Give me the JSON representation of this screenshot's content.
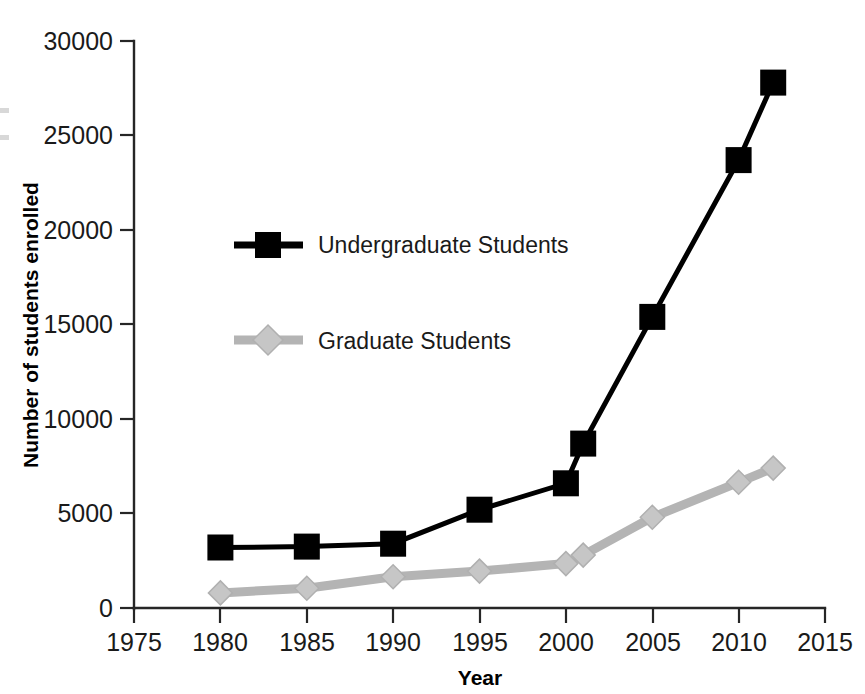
{
  "chart_data": {
    "type": "line",
    "title": "",
    "xlabel": "Year",
    "ylabel": "Number of students enrolled",
    "xlim": [
      1975,
      2015
    ],
    "ylim": [
      0,
      30000
    ],
    "xticks": [
      1975,
      1980,
      1985,
      1990,
      1995,
      2000,
      2005,
      2010,
      2015
    ],
    "xtick_labels": [
      "1975",
      "1980",
      "1985",
      "1990",
      "1995",
      "2000",
      "2005",
      "2010",
      "2015"
    ],
    "yticks": [
      0,
      5000,
      10000,
      15000,
      20000,
      25000,
      30000
    ],
    "ytick_labels": [
      "0",
      "5000",
      "10000",
      "15000",
      "20000",
      "25000",
      "30000"
    ],
    "grid": false,
    "legend_position": "upper-left-inside",
    "series": [
      {
        "name": "Undergraduate Students",
        "color": "#000000",
        "marker": "square",
        "x": [
          1980,
          1985,
          1990,
          1995,
          2000,
          2001,
          2005,
          2010,
          2012
        ],
        "values": [
          3200,
          3250,
          3400,
          5200,
          6600,
          8700,
          15400,
          23700,
          27800
        ]
      },
      {
        "name": "Graduate Students",
        "color": "#b4b4b4",
        "marker": "diamond",
        "x": [
          1980,
          1985,
          1990,
          1995,
          2000,
          2001,
          2005,
          2010,
          2012
        ],
        "values": [
          800,
          1050,
          1650,
          1950,
          2350,
          2800,
          4800,
          6650,
          7400
        ]
      }
    ]
  },
  "axis": {
    "x_title": "Year",
    "y_title": "Number of students enrolled"
  },
  "legend": {
    "entries": [
      {
        "label": "Undergraduate Students"
      },
      {
        "label": "Graduate Students"
      }
    ]
  }
}
